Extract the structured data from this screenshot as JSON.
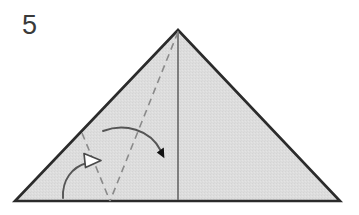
{
  "diagram": {
    "kind": "origami-fold-instruction",
    "step_number": "5",
    "background_color": "#ffffff",
    "paper_fill_color": "#dcdcdc",
    "paper_edge_color": "#2b2b2b",
    "crease_line_color": "#8a8a8a",
    "solid_fold_line_color": "#6e6e6e",
    "arrow_stroke_color": "#555555",
    "valley_arrow_fill": "#111111",
    "unfold_arrow_fill": "#ffffff",
    "shape": {
      "name": "triangle",
      "apex": [
        178,
        30
      ],
      "bottom_left": [
        15,
        201
      ],
      "bottom_right": [
        340,
        201
      ]
    },
    "lines": [
      {
        "name": "center-vertical-fold",
        "style": "solid",
        "from": [
          178,
          30
        ],
        "to": [
          178,
          201
        ]
      },
      {
        "name": "diagonal-crease-from-apex",
        "style": "dashed",
        "from": [
          178,
          30
        ],
        "to": [
          110,
          201
        ]
      },
      {
        "name": "short-crease-to-left-edge",
        "style": "dashed",
        "from": [
          82,
          133
        ],
        "to": [
          110,
          201
        ]
      }
    ],
    "arrows": [
      {
        "name": "valley-fold-arrow",
        "head_style": "filled",
        "fill": "#111111",
        "start": [
          103,
          130
        ],
        "end": [
          165,
          158
        ],
        "direction": "right-down"
      },
      {
        "name": "unfold-arrow",
        "head_style": "hollow",
        "fill": "#ffffff",
        "start": [
          63,
          197
        ],
        "end": [
          95,
          159
        ],
        "direction": "up-right"
      }
    ]
  }
}
